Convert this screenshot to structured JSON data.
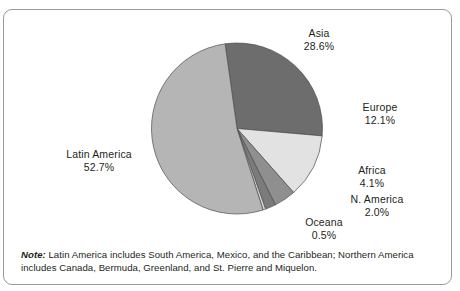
{
  "figure": {
    "note_label": "Note:",
    "note_text": " Latin America includes South America, Mexico, and the Caribbean; Northern America includes Canada, Bermuda, Greenland, and St. Pierre and Miquelon."
  },
  "chart_data": {
    "type": "pie",
    "title": "",
    "subtitle": "",
    "xlabel": "",
    "ylabel": "",
    "legend_position": "none",
    "grid": false,
    "start_angle_deg": -8,
    "direction": "clockwise",
    "labels": [
      "Asia",
      "Europe",
      "Africa",
      "N. America",
      "Oceana",
      "Latin America"
    ],
    "values": [
      28.6,
      12.1,
      4.1,
      2.0,
      0.5,
      52.7
    ],
    "value_labels": [
      "28.6%",
      "12.1%",
      "4.1%",
      "2.0%",
      "0.5%",
      "52.7%"
    ],
    "colors": [
      "#6d6d6d",
      "#e2e2e2",
      "#8f8f8f",
      "#7b7b7b",
      "#d6d6d6",
      "#b5b5b5"
    ],
    "slice_outline_color": "#4d4d4d",
    "slices": [
      {
        "label": "Asia",
        "value": 28.6,
        "value_label": "28.6%",
        "color": "#6d6d6d"
      },
      {
        "label": "Europe",
        "value": 12.1,
        "value_label": "12.1%",
        "color": "#e2e2e2"
      },
      {
        "label": "Africa",
        "value": 4.1,
        "value_label": "4.1%",
        "color": "#8f8f8f"
      },
      {
        "label": "N. America",
        "value": 2.0,
        "value_label": "2.0%",
        "color": "#7b7b7b"
      },
      {
        "label": "Oceana",
        "value": 0.5,
        "value_label": "0.5%",
        "color": "#d6d6d6"
      },
      {
        "label": "Latin America",
        "value": 52.7,
        "value_label": "52.7%",
        "color": "#b5b5b5"
      }
    ]
  }
}
